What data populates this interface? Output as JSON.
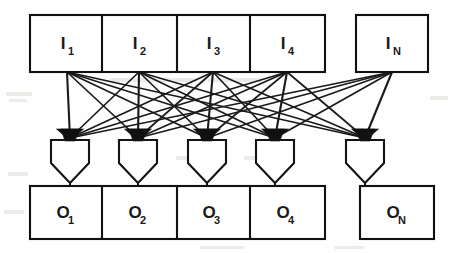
{
  "figure": {
    "type": "node-link-diagram",
    "background_color": "#fefefe",
    "line_color": "#111111",
    "box_fill": "#ffffff"
  },
  "input_row": {
    "name": "input-register-row",
    "y_top": 15,
    "y_bottom": 72,
    "nodes": [
      {
        "id": "I1",
        "letter": "I",
        "subscript": "1",
        "x_left": 30,
        "x_right": 102,
        "center_x": 67
      },
      {
        "id": "I2",
        "letter": "I",
        "subscript": "2",
        "x_left": 102,
        "x_right": 177,
        "center_x": 139
      },
      {
        "id": "I3",
        "letter": "I",
        "subscript": "3",
        "x_left": 177,
        "x_right": 250,
        "center_x": 213
      },
      {
        "id": "I4",
        "letter": "I",
        "subscript": "4",
        "x_left": 250,
        "x_right": 325,
        "center_x": 287
      },
      {
        "id": "IN",
        "letter": "I",
        "subscript": "N",
        "x_left": 356,
        "x_right": 428,
        "center_x": 392
      }
    ]
  },
  "funnel_row": {
    "name": "funnel-multiplexer-row",
    "y_top": 140,
    "y_shoulder": 163,
    "y_tip": 183,
    "half_width": 19,
    "nodes": [
      {
        "id": "F1",
        "center_x": 70
      },
      {
        "id": "F2",
        "center_x": 138
      },
      {
        "id": "F3",
        "center_x": 207
      },
      {
        "id": "F4",
        "center_x": 275
      },
      {
        "id": "F5",
        "center_x": 365
      }
    ]
  },
  "output_row": {
    "name": "output-register-row",
    "y_top": 186,
    "y_bottom": 239,
    "nodes": [
      {
        "id": "O1",
        "letter": "O",
        "subscript": "1",
        "x_left": 30,
        "x_right": 102,
        "center_x": 67
      },
      {
        "id": "O2",
        "letter": "O",
        "subscript": "2",
        "x_left": 102,
        "x_right": 177,
        "center_x": 139
      },
      {
        "id": "O3",
        "letter": "O",
        "subscript": "3",
        "x_left": 177,
        "x_right": 250,
        "center_x": 213
      },
      {
        "id": "O4",
        "letter": "O",
        "subscript": "4",
        "x_left": 250,
        "x_right": 325,
        "center_x": 287
      },
      {
        "id": "ON",
        "letter": "O",
        "subscript": "N",
        "x_left": 360,
        "x_right": 434,
        "center_x": 397
      }
    ]
  },
  "edges": {
    "name": "full-crossbar-edges",
    "description": "Every input tap fans out to every funnel arrowhead",
    "source_y": 72,
    "target_y": 138,
    "source_x": [
      67,
      139,
      213,
      287,
      392
    ],
    "target_x": [
      70,
      138,
      207,
      275,
      365
    ],
    "count": 25
  },
  "drops": {
    "name": "funnel-to-output-drops",
    "segments": [
      {
        "from_x": 70,
        "from_y": 183,
        "to_y": 186
      },
      {
        "from_x": 138,
        "from_y": 183,
        "to_y": 186
      },
      {
        "from_x": 207,
        "from_y": 183,
        "to_y": 186
      },
      {
        "from_x": 275,
        "from_y": 183,
        "to_y": 186
      },
      {
        "from_x": 365,
        "from_y": 183,
        "to_y": 186
      }
    ]
  }
}
